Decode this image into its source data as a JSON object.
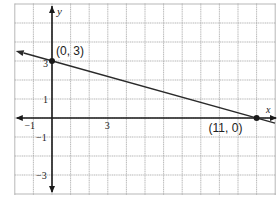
{
  "chart_data": {
    "type": "line",
    "title": "",
    "xlabel": "x",
    "ylabel": "y",
    "xlim": [
      -2,
      12
    ],
    "ylim": [
      -4,
      6
    ],
    "grid": true,
    "grid_step": 1,
    "x_tick_labels": [
      {
        "value": -1,
        "label": "−1"
      },
      {
        "value": 3,
        "label": "3"
      }
    ],
    "y_tick_labels": [
      {
        "value": 3,
        "label": "3"
      },
      {
        "value": 1,
        "label": "1"
      },
      {
        "value": -1,
        "label": "−1"
      },
      {
        "value": -3,
        "label": "−3"
      }
    ],
    "series": [
      {
        "name": "line",
        "x": [
          -2,
          11,
          12
        ],
        "y": [
          3.545,
          0,
          -0.273
        ],
        "equation": "y = -3/11 x + 3"
      }
    ],
    "points": [
      {
        "x": 0,
        "y": 3,
        "label": "(0, 3)"
      },
      {
        "x": 11,
        "y": 0,
        "label": "(11, 0)"
      }
    ],
    "colors": {
      "grid": "#9a9a9a",
      "axis": "#1a1a1a",
      "line": "#2a2a2a",
      "text": "#222222"
    }
  }
}
